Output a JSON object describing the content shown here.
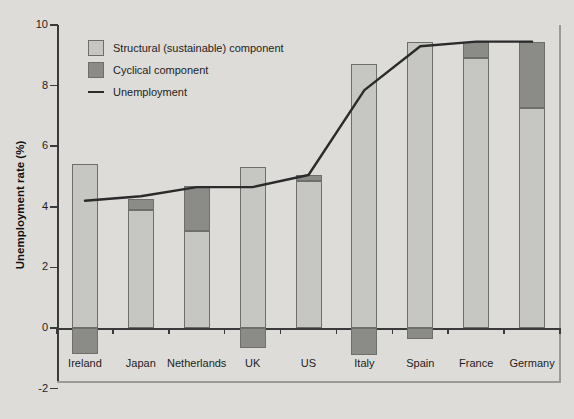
{
  "chart_data": {
    "type": "bar",
    "title": "",
    "subtitle": "",
    "xlabel": "",
    "ylabel": "Unemployment rate (%)",
    "ylim": [
      -2,
      10
    ],
    "ytick_values": [
      -2,
      0,
      2,
      4,
      6,
      8,
      10
    ],
    "ytick_labels": [
      "-2",
      "0",
      "2",
      "4",
      "6",
      "8",
      "10"
    ],
    "grid": false,
    "legend_position": "top-left",
    "categories": [
      "Ireland",
      "Japan",
      "Netherlands",
      "UK",
      "US",
      "Italy",
      "Spain",
      "France",
      "Germany"
    ],
    "series": [
      {
        "name": "Structural (sustainable) component",
        "type": "bar-segment",
        "color": "#c6c6c2",
        "values": [
          5.4,
          3.9,
          3.2,
          5.3,
          4.85,
          8.7,
          9.45,
          8.9,
          7.25
        ]
      },
      {
        "name": "Cyclical component",
        "type": "bar-segment",
        "color": "#8b8b88",
        "values": [
          -0.85,
          0.35,
          1.5,
          -0.65,
          0.2,
          -0.9,
          -0.35,
          0.55,
          2.2
        ]
      },
      {
        "name": "Unemployment",
        "type": "line",
        "color": "#2b2b2b",
        "values": [
          4.2,
          4.35,
          4.65,
          4.65,
          5.05,
          7.85,
          9.3,
          9.45,
          9.45
        ]
      }
    ],
    "legend_entries": [
      {
        "label": "Structural (sustainable) component",
        "marker": "square",
        "color": "#c6c6c2"
      },
      {
        "label": "Cyclical component",
        "marker": "square",
        "color": "#8b8b88"
      },
      {
        "label": "Unemployment",
        "marker": "line",
        "color": "#2b2b2b"
      }
    ],
    "colors": {
      "background": "#dddcd8",
      "axis": "#3a3a3a",
      "frame": "#9a9a96",
      "structural": "#c6c6c2",
      "cyclical": "#8b8b88",
      "line": "#2b2b2b",
      "text": "#1d1d1d"
    }
  }
}
